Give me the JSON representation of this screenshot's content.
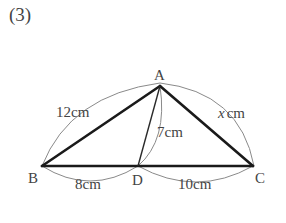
{
  "problem": {
    "number_label": "(3)"
  },
  "figure": {
    "type": "triangle",
    "vertices": {
      "A": {
        "label": "A",
        "x": 160,
        "y": 86
      },
      "B": {
        "label": "B",
        "x": 42,
        "y": 166
      },
      "C": {
        "label": "C",
        "x": 253,
        "y": 166
      },
      "D": {
        "label": "D",
        "x": 138,
        "y": 166
      }
    },
    "segments": [
      {
        "from": "A",
        "to": "B",
        "style": "thick"
      },
      {
        "from": "A",
        "to": "C",
        "style": "thick"
      },
      {
        "from": "B",
        "to": "C",
        "style": "thick"
      },
      {
        "from": "A",
        "to": "D",
        "style": "thin"
      }
    ],
    "measures": {
      "AB": {
        "value": "12",
        "unit": "cm"
      },
      "AC": {
        "value": "x",
        "unit": "cm"
      },
      "AD": {
        "value": "7",
        "unit": "cm"
      },
      "BD": {
        "value": "8",
        "unit": "cm"
      },
      "DC": {
        "value": "10",
        "unit": "cm"
      }
    },
    "colors": {
      "thick_line": "#1a1a1a",
      "thin_line": "#2a2a2a",
      "arc": "#8a8a8a",
      "text": "#444444"
    }
  }
}
